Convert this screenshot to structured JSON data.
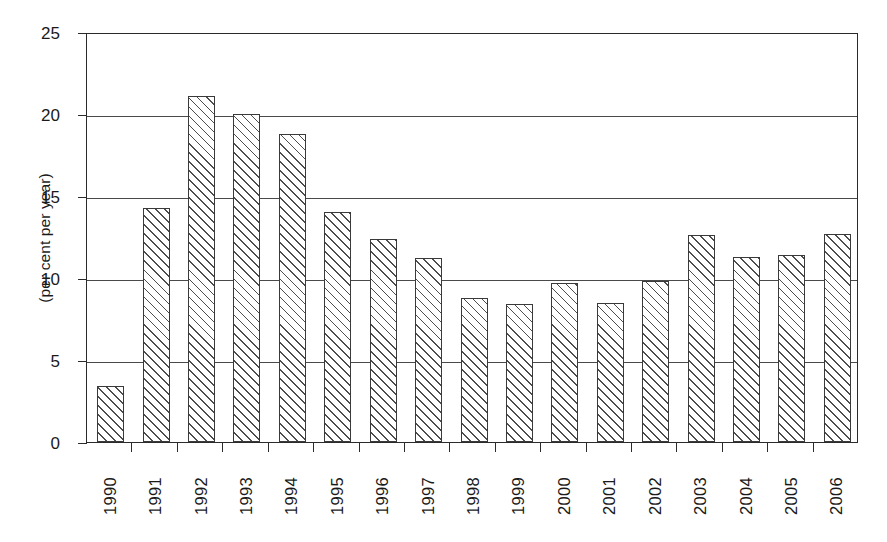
{
  "chart_data": {
    "type": "bar",
    "title": "",
    "xlabel": "",
    "ylabel": "(per cent per year)",
    "categories": [
      "1990",
      "1991",
      "1992",
      "1993",
      "1994",
      "1995",
      "1996",
      "1997",
      "1998",
      "1999",
      "2000",
      "2001",
      "2002",
      "2003",
      "2004",
      "2005",
      "2006"
    ],
    "values": [
      3.4,
      14.3,
      21.1,
      20.0,
      18.8,
      14.0,
      12.4,
      11.2,
      8.8,
      8.4,
      9.7,
      8.5,
      9.8,
      12.6,
      11.3,
      11.4,
      12.7
    ],
    "ylim": [
      0,
      25
    ],
    "y_ticks": [
      0,
      5,
      10,
      15,
      20,
      25
    ],
    "y_tick_labels": [
      "0",
      "5",
      "10",
      "15",
      "20",
      "25"
    ],
    "grid": "horizontal",
    "legend": "none",
    "bar_fill": "diagonal-hatch",
    "bar_edge_color": "#3a3a3a",
    "axis_color": "#2b2b2b",
    "background_color": "#ffffff",
    "x_tick_label_rotation": 90
  }
}
